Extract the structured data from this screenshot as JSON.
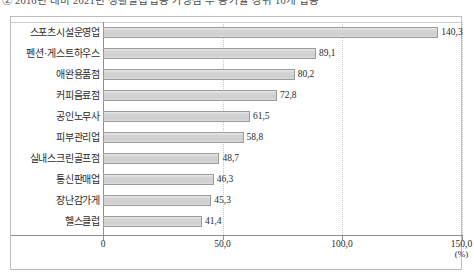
{
  "caption": "② 2016년 대비 2021년 생활밀접업종 가맹점 수 증가율 상위 10개 업종",
  "chart_data": {
    "type": "bar",
    "orientation": "horizontal",
    "title": "",
    "xlabel": "(%)",
    "ylabel": "",
    "unit": "(%)",
    "xlim": [
      0,
      150
    ],
    "xticks": [
      "0",
      "50,0",
      "100,0",
      "150,0"
    ],
    "xtick_values": [
      0,
      50,
      100,
      150
    ],
    "grid": "vertical-dotted",
    "legend": "none",
    "decimal_separator": ",",
    "categories": [
      "스포츠시설운영업",
      "펜션·게스트하우스",
      "애완용품점",
      "커피음료점",
      "공인노무사",
      "피부관리업",
      "실내스크린골프점",
      "통신판매업",
      "장난감가게",
      "헬스클럽"
    ],
    "values": [
      140.3,
      89.1,
      80.2,
      72.8,
      61.5,
      58.8,
      48.7,
      46.3,
      45.3,
      41.4
    ],
    "value_labels": [
      "140,3",
      "89,1",
      "80,2",
      "72,8",
      "61,5",
      "58,8",
      "48,7",
      "46,3",
      "45,3",
      "41,4"
    ],
    "bar_fill_color": "#d4d4d4",
    "bar_border_color": "#9b9b9b",
    "axis_color": "#8d9094",
    "grid_color": "#c4c7cb"
  }
}
